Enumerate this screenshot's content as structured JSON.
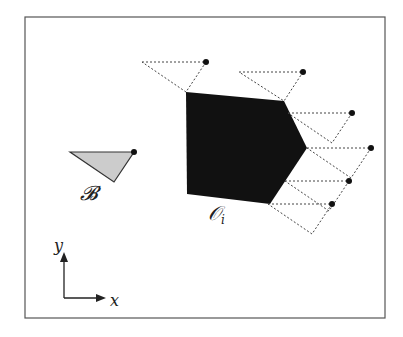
{
  "figure": {
    "robot_label": "𝓑",
    "obstacle_label": "𝒪",
    "obstacle_subscript": "i",
    "axis_x_label": "x",
    "axis_y_label": "y"
  },
  "colors": {
    "frame": "#555555",
    "obstacle": "#111111",
    "robot_fill": "#cccccc",
    "robot_stroke": "#333333",
    "dotted": "#444444",
    "dot": "#111111"
  },
  "geometry": {
    "frame": [
      25,
      17,
      360,
      301
    ],
    "obstacle": [
      [
        186,
        92
      ],
      [
        284,
        101
      ],
      [
        307,
        148
      ],
      [
        270,
        204
      ],
      [
        187,
        194
      ]
    ],
    "robot": [
      [
        70,
        152
      ],
      [
        134,
        152
      ],
      [
        114,
        182
      ]
    ],
    "robot_ref": [
      134,
      152
    ],
    "reflected_robot_offset_to_ref": [
      [
        -64,
        0
      ],
      [
        0,
        0
      ],
      [
        -20,
        30
      ]
    ],
    "ref_points": [
      [
        206,
        62
      ],
      [
        303,
        72
      ],
      [
        352,
        113
      ],
      [
        371,
        148
      ],
      [
        349,
        181
      ],
      [
        332,
        204
      ]
    ]
  }
}
